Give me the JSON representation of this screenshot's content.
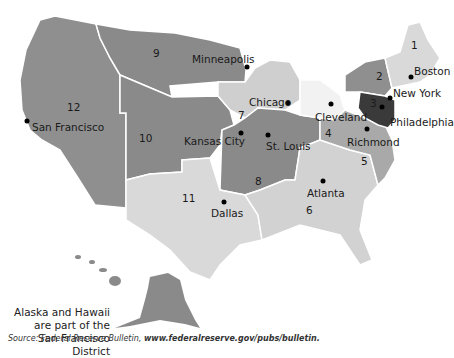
{
  "title_cropped": "(map of Federal Reserve districts — title cut off)",
  "map": {
    "colors": {
      "district_dark": "#8a8a8a",
      "district_mid": "#a6a6a6",
      "district_light": "#d9d9d9",
      "district_3": "#3a3a3a",
      "boundary": "#ffffff"
    },
    "districts": [
      {
        "number": "1",
        "city": "Boston"
      },
      {
        "number": "2",
        "city": "New York"
      },
      {
        "number": "3",
        "city": "Philadelphia"
      },
      {
        "number": "4",
        "city": "Cleveland"
      },
      {
        "number": "5",
        "city": "Richmond"
      },
      {
        "number": "6",
        "city": "Atlanta"
      },
      {
        "number": "7",
        "city": "Chicago"
      },
      {
        "number": "8",
        "city": "St. Louis"
      },
      {
        "number": "9",
        "city": "Minneapolis"
      },
      {
        "number": "10",
        "city": "Kansas City"
      },
      {
        "number": "11",
        "city": "Dallas"
      },
      {
        "number": "12",
        "city": "San Francisco"
      }
    ]
  },
  "note": {
    "line1": "Alaska and Hawaii",
    "line2": "are part of the",
    "line3": "San Francisco District"
  },
  "source": {
    "prefix": "Source: ",
    "publication": "Federal Reserve Bulletin,",
    "url": "www.federalreserve.gov/pubs/bulletin."
  }
}
